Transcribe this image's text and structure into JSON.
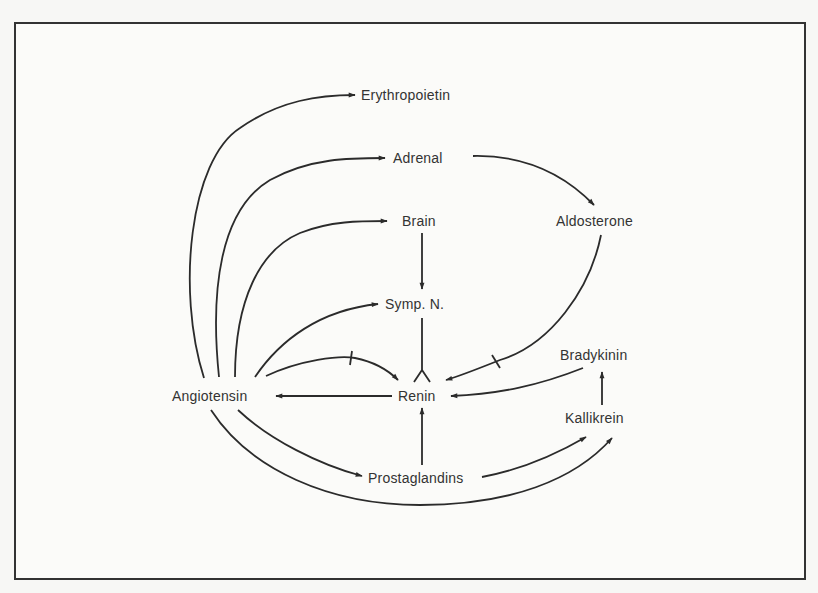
{
  "diagram": {
    "type": "renin-angiotensin regulatory network",
    "colors": {
      "line": "#2b2b2b",
      "text": "#333333",
      "frame": "#333333",
      "background": "#fbfbf9"
    },
    "nodes": {
      "erythropoietin": {
        "label": "Erythropoietin",
        "x": 361,
        "y": 87
      },
      "adrenal": {
        "label": "Adrenal",
        "x": 393,
        "y": 150
      },
      "brain": {
        "label": "Brain",
        "x": 402,
        "y": 213
      },
      "aldosterone": {
        "label": "Aldosterone",
        "x": 556,
        "y": 213
      },
      "symp_n": {
        "label": "Symp. N.",
        "x": 385,
        "y": 296
      },
      "angiotensin": {
        "label": "Angiotensin",
        "x": 172,
        "y": 388
      },
      "renin": {
        "label": "Renin",
        "x": 398,
        "y": 388
      },
      "bradykinin": {
        "label": "Bradykinin",
        "x": 560,
        "y": 347
      },
      "kallikrein": {
        "label": "Kallikrein",
        "x": 565,
        "y": 410
      },
      "prostaglandins": {
        "label": "Prostaglandins",
        "x": 368,
        "y": 470
      }
    },
    "edges": [
      {
        "from": "Angiotensin",
        "to": "Erythropoietin",
        "type": "stimulate"
      },
      {
        "from": "Angiotensin",
        "to": "Adrenal",
        "type": "stimulate"
      },
      {
        "from": "Angiotensin",
        "to": "Brain",
        "type": "stimulate"
      },
      {
        "from": "Angiotensin",
        "to": "Symp. N.",
        "type": "stimulate"
      },
      {
        "from": "Angiotensin",
        "to": "Renin",
        "type": "inhibit"
      },
      {
        "from": "Angiotensin",
        "to": "Prostaglandins",
        "type": "stimulate"
      },
      {
        "from": "Angiotensin",
        "to": "Kallikrein",
        "type": "stimulate"
      },
      {
        "from": "Adrenal",
        "to": "Aldosterone",
        "type": "stimulate"
      },
      {
        "from": "Aldosterone",
        "to": "Renin",
        "type": "inhibit"
      },
      {
        "from": "Brain",
        "to": "Symp. N.",
        "type": "stimulate"
      },
      {
        "from": "Symp. N.",
        "to": "Renin",
        "type": "stimulate"
      },
      {
        "from": "Renin",
        "to": "Angiotensin",
        "type": "stimulate"
      },
      {
        "from": "Bradykinin",
        "to": "Renin",
        "type": "stimulate"
      },
      {
        "from": "Kallikrein",
        "to": "Bradykinin",
        "type": "stimulate"
      },
      {
        "from": "Prostaglandins",
        "to": "Renin",
        "type": "stimulate"
      },
      {
        "from": "Prostaglandins",
        "to": "Kallikrein",
        "type": "stimulate"
      }
    ]
  }
}
